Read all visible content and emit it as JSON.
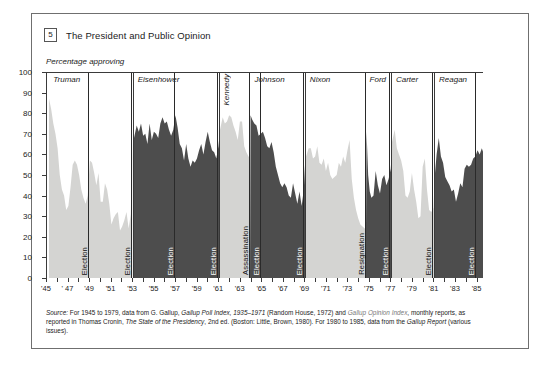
{
  "figure": {
    "number": "5",
    "title": "The President and Public Opinion",
    "ylabel": "Percentage approving"
  },
  "source": {
    "line1_label": "Source:",
    "line1": " For 1945 to 1979, data from G. Gallup, Gallup Poll Index, 1935–1971 (Random House, 1972) and Gallup Opinion Index, monthly reports, as",
    "line2": "reported in Thomas Cronin, The State of the Presidency, 2nd ed. (Boston: Little, Brown, 1980). For 1980 to 1985, data from the Gallup Report (various issues)."
  },
  "colors": {
    "light_fill": "#d4d4d2",
    "dark_fill": "#4d4d4d",
    "axis": "#3a3a3a",
    "frame": "#6f6f6f",
    "text": "#1b1b1b"
  },
  "chart_data": {
    "type": "area",
    "title": "The President and Public Opinion",
    "xlabel": "",
    "ylabel": "Percentage approving",
    "ylim": [
      0,
      100
    ],
    "xlim": [
      1945,
      1985.6
    ],
    "yticks": [
      0,
      10,
      20,
      30,
      40,
      50,
      60,
      70,
      80,
      90,
      100
    ],
    "xticks": [
      1945,
      1946,
      1947,
      1948,
      1949,
      1950,
      1951,
      1952,
      1953,
      1954,
      1955,
      1956,
      1957,
      1958,
      1959,
      1960,
      1961,
      1962,
      1963,
      1964,
      1965,
      1966,
      1967,
      1968,
      1969,
      1970,
      1971,
      1972,
      1973,
      1974,
      1975,
      1976,
      1977,
      1978,
      1979,
      1980,
      1981,
      1982,
      1983,
      1984,
      1985
    ],
    "xticklabels": [
      "'45",
      "",
      "' 47",
      "",
      "'49",
      "",
      "'51",
      "",
      "'53",
      "",
      "'55",
      "",
      "'57",
      "",
      "'59",
      "",
      "'61",
      "",
      "'63",
      "",
      "'65",
      "",
      "'67",
      "",
      "'69",
      "",
      "'71",
      "",
      "'73",
      "",
      "'75",
      "",
      "'77",
      "",
      "'79",
      "",
      "'81",
      "",
      "'83",
      "",
      "'85"
    ],
    "grid": false,
    "legend": null,
    "annotations": [
      {
        "text": "Election",
        "year": 1948.9,
        "orientation": "vertical"
      },
      {
        "text": "Election",
        "year": 1952.9,
        "orientation": "vertical"
      },
      {
        "text": "Election",
        "year": 1956.9,
        "orientation": "vertical"
      },
      {
        "text": "Election",
        "year": 1960.9,
        "orientation": "vertical"
      },
      {
        "text": "Assassination",
        "year": 1963.85,
        "orientation": "vertical"
      },
      {
        "text": "Election",
        "year": 1964.9,
        "orientation": "vertical"
      },
      {
        "text": "Election",
        "year": 1968.9,
        "orientation": "vertical"
      },
      {
        "text": "Resignation",
        "year": 1974.6,
        "orientation": "vertical"
      },
      {
        "text": "Election",
        "year": 1976.9,
        "orientation": "vertical"
      },
      {
        "text": "Election",
        "year": 1980.9,
        "orientation": "vertical"
      },
      {
        "text": "Election",
        "year": 1984.9,
        "orientation": "vertical"
      }
    ],
    "presidents": [
      {
        "name": "Truman",
        "start": 1945.3,
        "end": 1953.05,
        "shade": "light"
      },
      {
        "name": "Eisenhower",
        "start": 1953.05,
        "end": 1961.05,
        "shade": "dark"
      },
      {
        "name": "Kennedy",
        "start": 1961.05,
        "end": 1963.9,
        "shade": "light",
        "label_orientation": "vertical"
      },
      {
        "name": "Johnson",
        "start": 1963.9,
        "end": 1969.05,
        "shade": "dark"
      },
      {
        "name": "Nixon",
        "start": 1969.05,
        "end": 1974.6,
        "shade": "light"
      },
      {
        "name": "Ford",
        "start": 1974.6,
        "end": 1977.05,
        "shade": "dark"
      },
      {
        "name": "Carter",
        "start": 1977.05,
        "end": 1981.05,
        "shade": "light"
      },
      {
        "name": "Reagan",
        "start": 1981.05,
        "end": 1985.6,
        "shade": "dark"
      }
    ],
    "series": [
      {
        "name": "Presidential approval",
        "units": "percent approving",
        "points": [
          [
            1945.3,
            87
          ],
          [
            1945.5,
            82
          ],
          [
            1945.7,
            75
          ],
          [
            1945.9,
            70
          ],
          [
            1946.1,
            63
          ],
          [
            1946.3,
            50
          ],
          [
            1946.5,
            43
          ],
          [
            1946.7,
            40
          ],
          [
            1946.9,
            33
          ],
          [
            1947.1,
            35
          ],
          [
            1947.3,
            44
          ],
          [
            1947.5,
            55
          ],
          [
            1947.7,
            57
          ],
          [
            1947.9,
            55
          ],
          [
            1948.1,
            50
          ],
          [
            1948.3,
            43
          ],
          [
            1948.5,
            39
          ],
          [
            1948.7,
            36
          ],
          [
            1948.9,
            40
          ],
          [
            1949.1,
            57
          ],
          [
            1949.3,
            56
          ],
          [
            1949.5,
            51
          ],
          [
            1949.7,
            45
          ],
          [
            1949.9,
            51
          ],
          [
            1950.1,
            37
          ],
          [
            1950.3,
            37
          ],
          [
            1950.5,
            46
          ],
          [
            1950.7,
            43
          ],
          [
            1950.9,
            36
          ],
          [
            1951.1,
            26
          ],
          [
            1951.3,
            29
          ],
          [
            1951.5,
            31
          ],
          [
            1951.7,
            32
          ],
          [
            1951.9,
            23
          ],
          [
            1952.1,
            25
          ],
          [
            1952.3,
            28
          ],
          [
            1952.5,
            32
          ],
          [
            1952.7,
            24
          ],
          [
            1952.9,
            31
          ],
          [
            1953.05,
            68
          ],
          [
            1953.3,
            74
          ],
          [
            1953.5,
            71
          ],
          [
            1953.7,
            75
          ],
          [
            1953.9,
            69
          ],
          [
            1954.1,
            70
          ],
          [
            1954.3,
            65
          ],
          [
            1954.5,
            75
          ],
          [
            1954.7,
            67
          ],
          [
            1954.9,
            71
          ],
          [
            1955.1,
            70
          ],
          [
            1955.3,
            68
          ],
          [
            1955.5,
            75
          ],
          [
            1955.7,
            78
          ],
          [
            1955.9,
            75
          ],
          [
            1956.1,
            76
          ],
          [
            1956.3,
            72
          ],
          [
            1956.5,
            69
          ],
          [
            1956.7,
            72
          ],
          [
            1956.9,
            79
          ],
          [
            1957.1,
            73
          ],
          [
            1957.3,
            65
          ],
          [
            1957.5,
            63
          ],
          [
            1957.7,
            57
          ],
          [
            1957.9,
            65
          ],
          [
            1958.1,
            58
          ],
          [
            1958.3,
            54
          ],
          [
            1958.5,
            57
          ],
          [
            1958.7,
            56
          ],
          [
            1958.9,
            58
          ],
          [
            1959.1,
            62
          ],
          [
            1959.3,
            65
          ],
          [
            1959.5,
            60
          ],
          [
            1959.7,
            66
          ],
          [
            1959.9,
            71
          ],
          [
            1960.1,
            66
          ],
          [
            1960.3,
            62
          ],
          [
            1960.5,
            61
          ],
          [
            1960.7,
            58
          ],
          [
            1960.9,
            64
          ],
          [
            1961.05,
            72
          ],
          [
            1961.3,
            78
          ],
          [
            1961.5,
            75
          ],
          [
            1961.7,
            76
          ],
          [
            1961.9,
            79
          ],
          [
            1962.1,
            78
          ],
          [
            1962.3,
            74
          ],
          [
            1962.5,
            71
          ],
          [
            1962.7,
            67
          ],
          [
            1962.9,
            76
          ],
          [
            1963.1,
            76
          ],
          [
            1963.3,
            64
          ],
          [
            1963.5,
            61
          ],
          [
            1963.7,
            59
          ],
          [
            1963.85,
            58
          ],
          [
            1963.95,
            79
          ],
          [
            1964.1,
            77
          ],
          [
            1964.3,
            75
          ],
          [
            1964.5,
            74
          ],
          [
            1964.7,
            69
          ],
          [
            1964.9,
            70
          ],
          [
            1965.1,
            71
          ],
          [
            1965.3,
            68
          ],
          [
            1965.5,
            64
          ],
          [
            1965.7,
            63
          ],
          [
            1965.9,
            66
          ],
          [
            1966.1,
            61
          ],
          [
            1966.3,
            54
          ],
          [
            1966.5,
            50
          ],
          [
            1966.7,
            46
          ],
          [
            1966.9,
            44
          ],
          [
            1967.1,
            46
          ],
          [
            1967.3,
            44
          ],
          [
            1967.5,
            40
          ],
          [
            1967.7,
            39
          ],
          [
            1967.9,
            46
          ],
          [
            1968.1,
            41
          ],
          [
            1968.3,
            36
          ],
          [
            1968.5,
            42
          ],
          [
            1968.7,
            35
          ],
          [
            1968.9,
            43
          ],
          [
            1969.05,
            59
          ],
          [
            1969.3,
            63
          ],
          [
            1969.5,
            63
          ],
          [
            1969.7,
            58
          ],
          [
            1969.9,
            59
          ],
          [
            1970.1,
            64
          ],
          [
            1970.3,
            56
          ],
          [
            1970.5,
            55
          ],
          [
            1970.7,
            58
          ],
          [
            1970.9,
            52
          ],
          [
            1971.1,
            56
          ],
          [
            1971.3,
            50
          ],
          [
            1971.5,
            48
          ],
          [
            1971.7,
            49
          ],
          [
            1971.9,
            50
          ],
          [
            1972.1,
            56
          ],
          [
            1972.3,
            54
          ],
          [
            1972.5,
            59
          ],
          [
            1972.7,
            56
          ],
          [
            1972.9,
            62
          ],
          [
            1973.1,
            67
          ],
          [
            1973.3,
            48
          ],
          [
            1973.5,
            39
          ],
          [
            1973.7,
            33
          ],
          [
            1973.9,
            29
          ],
          [
            1974.1,
            26
          ],
          [
            1974.3,
            25
          ],
          [
            1974.5,
            24
          ],
          [
            1974.6,
            24
          ],
          [
            1974.65,
            71
          ],
          [
            1974.8,
            50
          ],
          [
            1974.95,
            42
          ],
          [
            1975.1,
            39
          ],
          [
            1975.3,
            40
          ],
          [
            1975.5,
            52
          ],
          [
            1975.7,
            45
          ],
          [
            1975.9,
            41
          ],
          [
            1976.1,
            48
          ],
          [
            1976.3,
            50
          ],
          [
            1976.5,
            45
          ],
          [
            1976.7,
            48
          ],
          [
            1976.9,
            53
          ],
          [
            1977.05,
            66
          ],
          [
            1977.3,
            72
          ],
          [
            1977.5,
            63
          ],
          [
            1977.7,
            60
          ],
          [
            1977.9,
            57
          ],
          [
            1978.1,
            52
          ],
          [
            1978.3,
            40
          ],
          [
            1978.5,
            39
          ],
          [
            1978.7,
            42
          ],
          [
            1978.9,
            51
          ],
          [
            1979.1,
            43
          ],
          [
            1979.3,
            37
          ],
          [
            1979.5,
            29
          ],
          [
            1979.7,
            30
          ],
          [
            1979.9,
            54
          ],
          [
            1980.1,
            58
          ],
          [
            1980.3,
            43
          ],
          [
            1980.5,
            33
          ],
          [
            1980.7,
            32
          ],
          [
            1980.9,
            34
          ],
          [
            1981.05,
            51
          ],
          [
            1981.2,
            60
          ],
          [
            1981.4,
            68
          ],
          [
            1981.6,
            59
          ],
          [
            1981.8,
            56
          ],
          [
            1982.0,
            49
          ],
          [
            1982.2,
            47
          ],
          [
            1982.4,
            45
          ],
          [
            1982.6,
            42
          ],
          [
            1982.8,
            43
          ],
          [
            1983.0,
            37
          ],
          [
            1983.2,
            41
          ],
          [
            1983.4,
            46
          ],
          [
            1983.6,
            44
          ],
          [
            1983.8,
            53
          ],
          [
            1984.0,
            55
          ],
          [
            1984.2,
            54
          ],
          [
            1984.4,
            55
          ],
          [
            1984.6,
            58
          ],
          [
            1984.8,
            59
          ],
          [
            1985.0,
            62
          ],
          [
            1985.2,
            60
          ],
          [
            1985.4,
            63
          ],
          [
            1985.6,
            60
          ]
        ]
      }
    ]
  }
}
